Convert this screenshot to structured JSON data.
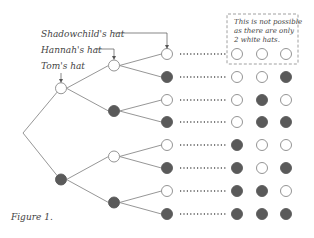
{
  "labels": {
    "shadowchild": "Shadowchild's hat",
    "hannah": "Hannah's hat",
    "tom": "Tom's hat"
  },
  "note_lines": [
    "This is not possible",
    "as there are only",
    "2 white hats."
  ],
  "caption": "Figure 1.",
  "colors": {
    "white_hat": "#ffffff",
    "black_hat": "#5a5a5a",
    "outline": "#888888"
  },
  "tree": {
    "tom": [
      "white",
      "black"
    ],
    "hannah": [
      "white",
      "black",
      "white",
      "black"
    ],
    "shadowchild": [
      "white",
      "black",
      "white",
      "black",
      "white",
      "black",
      "white",
      "black"
    ]
  },
  "outcomes": [
    [
      "white",
      "white",
      "white"
    ],
    [
      "white",
      "white",
      "black"
    ],
    [
      "white",
      "black",
      "white"
    ],
    [
      "white",
      "black",
      "black"
    ],
    [
      "black",
      "white",
      "white"
    ],
    [
      "black",
      "white",
      "black"
    ],
    [
      "black",
      "black",
      "white"
    ],
    [
      "black",
      "black",
      "black"
    ]
  ],
  "impossible_outcome_index": 0
}
